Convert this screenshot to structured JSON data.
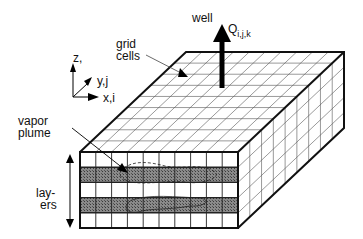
{
  "labels": {
    "well": "well",
    "flow_symbol": "Q",
    "flow_subscript": "i,j,k",
    "grid_cells_line1": "grid",
    "grid_cells_line2": "cells",
    "vapor_line1": "vapor",
    "vapor_line2": "plume",
    "layers_line1": "lay-",
    "layers_line2": "ers",
    "axis_z": "z,",
    "axis_z2": "k",
    "axis_y": "y,j",
    "axis_x": "x,i"
  },
  "grid": {
    "front_columns": 10,
    "layers": 5,
    "shaded_layers": [
      1,
      3
    ],
    "depth_cells": 9
  },
  "colors": {
    "line": "#111111",
    "grid_line": "#555555",
    "shade": "#6e6e6e",
    "background": "#ffffff"
  }
}
